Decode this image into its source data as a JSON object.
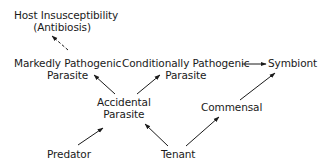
{
  "diagram": {
    "nodes": {
      "host_insusceptibility": {
        "line1": "Host Insusceptibility",
        "line2": "(Antibiosis)"
      },
      "markedly_pathogenic": {
        "line1": "Markedly Pathogenic",
        "line2": "Parasite"
      },
      "conditionally_pathogenic": {
        "line1": "Conditionally Pathogenic",
        "line2": "Parasite"
      },
      "symbiont": {
        "line1": "Symbiont"
      },
      "accidental_parasite": {
        "line1": "Accidental",
        "line2": "Parasite"
      },
      "commensal": {
        "line1": "Commensal"
      },
      "predator": {
        "line1": "Predator"
      },
      "tenant": {
        "line1": "Tenant"
      }
    },
    "edges": [
      {
        "from": "Markedly Pathogenic Parasite",
        "to": "Host Insusceptibility (Antibiosis)",
        "style": "dashed"
      },
      {
        "from": "Accidental Parasite",
        "to": "Markedly Pathogenic Parasite",
        "style": "solid"
      },
      {
        "from": "Accidental Parasite",
        "to": "Conditionally Pathogenic Parasite",
        "style": "solid"
      },
      {
        "from": "Conditionally Pathogenic Parasite",
        "to": "Symbiont",
        "style": "solid"
      },
      {
        "from": "Commensal",
        "to": "Symbiont",
        "style": "solid"
      },
      {
        "from": "Predator",
        "to": "Accidental Parasite",
        "style": "solid"
      },
      {
        "from": "Tenant",
        "to": "Accidental Parasite",
        "style": "solid"
      },
      {
        "from": "Tenant",
        "to": "Commensal",
        "style": "solid"
      }
    ]
  }
}
